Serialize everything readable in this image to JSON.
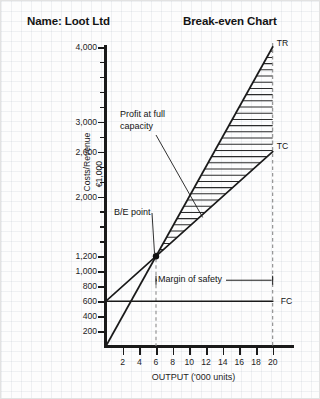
{
  "header": {
    "name_title": "Name: Loot Ltd",
    "chart_title": "Break-even Chart"
  },
  "chart_data": {
    "type": "line",
    "title": "Break-even Chart",
    "subtitle": "Name: Loot Ltd",
    "xlabel": "OUTPUT ('000 units)",
    "ylabel": "Costs/Revenue",
    "ylabel_unit": "€1,000",
    "xlim": [
      0,
      21
    ],
    "ylim": [
      0,
      4000
    ],
    "grid": false,
    "legend_position": "inline-right-of-lines",
    "x_ticks": [
      2,
      4,
      6,
      8,
      10,
      12,
      14,
      16,
      18,
      20
    ],
    "x_tick_labels": [
      "2",
      "4",
      "6",
      "8",
      "10",
      "12",
      "14",
      "16",
      "18",
      "20"
    ],
    "y_ticks": [
      200,
      400,
      600,
      800,
      1000,
      1200,
      1400,
      1600,
      1800,
      2000,
      2200,
      2400,
      2600,
      2800,
      3000,
      3200,
      3400,
      3600,
      3800,
      4000
    ],
    "y_tick_labels": [
      {
        "value": 200,
        "label": "200"
      },
      {
        "value": 400,
        "label": "400"
      },
      {
        "value": 600,
        "label": "600"
      },
      {
        "value": 800,
        "label": "800"
      },
      {
        "value": 1000,
        "label": "1,000"
      },
      {
        "value": 1200,
        "label": "1,200"
      },
      {
        "value": 2000,
        "label": "2,000"
      },
      {
        "value": 2600,
        "label": "2,600"
      },
      {
        "value": 3000,
        "label": "3,000"
      },
      {
        "value": 4000,
        "label": "4,000"
      }
    ],
    "series": [
      {
        "name": "TR",
        "label": "TR",
        "description": "Total Revenue",
        "x": [
          0,
          20
        ],
        "values": [
          0,
          4000
        ],
        "slope_per_1000_units": 200
      },
      {
        "name": "TC",
        "label": "TC",
        "description": "Total Cost",
        "x": [
          0,
          20
        ],
        "values": [
          600,
          2600
        ],
        "slope_per_1000_units": 100
      },
      {
        "name": "FC",
        "label": "FC",
        "description": "Fixed Cost",
        "x": [
          0,
          20
        ],
        "values": [
          600,
          600
        ],
        "slope_per_1000_units": 0
      }
    ],
    "break_even_point": {
      "x": 6,
      "y": 1200,
      "label": "B/E point"
    },
    "full_capacity": {
      "x": 20,
      "tr": 4000,
      "tc": 2600,
      "profit": 1400
    },
    "annotations": [
      {
        "text": "Profit at full capacity",
        "target": "hatched region between TR and TC"
      },
      {
        "text": "B/E point",
        "target": "intersection of TR and TC at 6,000 units"
      },
      {
        "text": "Margin of safety",
        "target": "horizontal span from 6,000 to 20,000 units"
      }
    ],
    "reference_lines": [
      {
        "x": 6,
        "style": "dashed",
        "label": "break-even output"
      },
      {
        "x": 20,
        "style": "dashed",
        "label": "full capacity output"
      }
    ]
  },
  "annotations": {
    "profit": "Profit at full capacity",
    "be_point": "B/E point",
    "margin_of_safety": "Margin of safety"
  },
  "series_labels": {
    "tr": "TR",
    "tc": "TC",
    "fc": "FC"
  },
  "axes": {
    "x_title": "OUTPUT ('000 units)",
    "y_title": "Costs/Revenue",
    "y_unit": "€1,000"
  },
  "colors": {
    "line": "#1a1a1a",
    "hatch": "#2b2b2b",
    "dashed": "#8c8c8c",
    "text": "#141414",
    "background": "#fdfdfd"
  }
}
